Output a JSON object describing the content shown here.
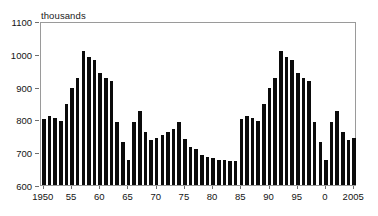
{
  "chart_data": {
    "type": "bar",
    "title": "",
    "subtitle": "",
    "units_label": "thousands",
    "xlabel": "",
    "ylabel": "",
    "ylim": [
      600,
      1100
    ],
    "xlim": [
      1950,
      2005
    ],
    "grid": false,
    "legend": null,
    "bar_color": "#0b0b0b",
    "frame_color": "#9a9a9a",
    "y_ticks": [
      600,
      700,
      800,
      900,
      1000,
      1100
    ],
    "y_tick_labels": [
      "600",
      "700",
      "800",
      "900",
      "1000",
      "1100"
    ],
    "x_ticks": [
      1950,
      1955,
      1960,
      1965,
      1970,
      1975,
      1980,
      1985,
      1990,
      1995,
      2000,
      2005
    ],
    "x_tick_labels": [
      "1950",
      "55",
      "60",
      "65",
      "70",
      "75",
      "80",
      "85",
      "90",
      "95",
      "0",
      "2005"
    ],
    "categories": [
      1950,
      1951,
      1952,
      1953,
      1954,
      1955,
      1956,
      1957,
      1958,
      1959,
      1960,
      1961,
      1962,
      1963,
      1964,
      1965,
      1966,
      1967,
      1968,
      1969,
      1970,
      1971,
      1972,
      1973,
      1974,
      1975,
      1976,
      1977,
      1978,
      1979,
      1980,
      1981,
      1982,
      1983,
      1984,
      1985,
      1986,
      1987,
      1988,
      1989,
      1990,
      1991,
      1992,
      1993,
      1994,
      1995,
      1996,
      1997,
      1998,
      1999,
      2000,
      2001,
      2002,
      2003,
      2004,
      2005
    ],
    "values": [
      800,
      809,
      805,
      796,
      846,
      895,
      925,
      1010,
      991,
      981,
      940,
      925,
      916,
      791,
      731,
      676,
      791,
      826,
      761,
      736,
      742,
      751,
      762,
      772,
      791,
      741,
      716,
      709,
      692,
      686,
      681,
      677,
      676,
      674,
      673,
      800,
      809,
      805,
      796,
      846,
      895,
      925,
      1010,
      991,
      981,
      940,
      925,
      916,
      791,
      731,
      676,
      791,
      826,
      761,
      736,
      742
    ],
    "series": [
      {
        "name": "annual value",
        "values": [
          800,
          809,
          805,
          796,
          846,
          895,
          925,
          1010,
          991,
          981,
          940,
          925,
          916,
          791,
          731,
          676,
          791,
          826,
          761,
          736,
          742,
          751,
          762,
          772,
          791,
          741,
          716,
          709,
          692,
          686,
          681,
          677,
          676,
          674,
          673,
          800,
          809,
          805,
          796,
          846,
          895,
          925,
          1010,
          991,
          981,
          940,
          925,
          916,
          791,
          731,
          676,
          791,
          826,
          761,
          736,
          742
        ]
      }
    ],
    "data_by_year": [
      {
        "year": 1950,
        "value": 800
      },
      {
        "year": 1951,
        "value": 809
      },
      {
        "year": 1952,
        "value": 805
      },
      {
        "year": 1953,
        "value": 796
      },
      {
        "year": 1954,
        "value": 846
      },
      {
        "year": 1955,
        "value": 895
      },
      {
        "year": 1956,
        "value": 925
      },
      {
        "year": 1957,
        "value": 1010
      },
      {
        "year": 1958,
        "value": 991
      },
      {
        "year": 1959,
        "value": 981
      },
      {
        "year": 1960,
        "value": 940
      },
      {
        "year": 1961,
        "value": 925
      },
      {
        "year": 1962,
        "value": 916
      },
      {
        "year": 1963,
        "value": 791
      },
      {
        "year": 1964,
        "value": 731
      },
      {
        "year": 1965,
        "value": 676
      },
      {
        "year": 1966,
        "value": 791
      },
      {
        "year": 1967,
        "value": 826
      },
      {
        "year": 1968,
        "value": 761
      },
      {
        "year": 1969,
        "value": 736
      },
      {
        "year": 1970,
        "value": 742
      },
      {
        "year": 1971,
        "value": 751
      },
      {
        "year": 1972,
        "value": 762
      },
      {
        "year": 1973,
        "value": 772
      },
      {
        "year": 1974,
        "value": 791
      },
      {
        "year": 1975,
        "value": 741
      },
      {
        "year": 1976,
        "value": 716
      },
      {
        "year": 1977,
        "value": 709
      },
      {
        "year": 1978,
        "value": 692
      },
      {
        "year": 1979,
        "value": 686
      },
      {
        "year": 1980,
        "value": 681
      },
      {
        "year": 1981,
        "value": 677
      },
      {
        "year": 1982,
        "value": 676
      },
      {
        "year": 1983,
        "value": 674
      },
      {
        "year": 1984,
        "value": 673
      },
      {
        "year": 1985,
        "value": 800
      },
      {
        "year": 1986,
        "value": 809
      },
      {
        "year": 1987,
        "value": 805
      },
      {
        "year": 1988,
        "value": 796
      },
      {
        "year": 1989,
        "value": 846
      },
      {
        "year": 1990,
        "value": 895
      },
      {
        "year": 1991,
        "value": 925
      },
      {
        "year": 1992,
        "value": 1010
      },
      {
        "year": 1993,
        "value": 991
      },
      {
        "year": 1994,
        "value": 981
      },
      {
        "year": 1995,
        "value": 940
      },
      {
        "year": 1996,
        "value": 925
      },
      {
        "year": 1997,
        "value": 916
      },
      {
        "year": 1998,
        "value": 791
      },
      {
        "year": 1999,
        "value": 731
      },
      {
        "year": 2000,
        "value": 676
      },
      {
        "year": 2001,
        "value": 791
      },
      {
        "year": 2002,
        "value": 826
      },
      {
        "year": 2003,
        "value": 761
      },
      {
        "year": 2004,
        "value": 736
      },
      {
        "year": 2005,
        "value": 742
      }
    ]
  }
}
